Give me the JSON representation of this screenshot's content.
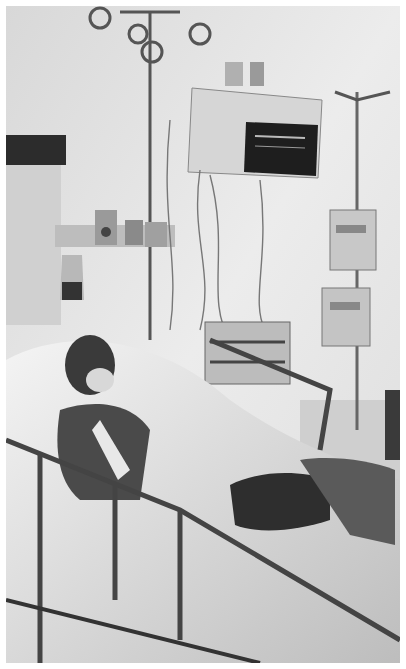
{
  "image": {
    "description": "Grayscale photograph of a patient lying in a hospital ICU bed, intubated, with a vital-signs monitor mounted on the wall, IV poles with infusion pumps, tubing and bed side rails",
    "palette": {
      "wall": "#e4e4e4",
      "dark": "#2a2a2a",
      "mid": "#8a8a8a",
      "sheet": "#f0f0f0",
      "border": "#ffffff"
    },
    "objects": [
      {
        "name": "vital-signs-monitor",
        "screen_color": "#1e1e1e"
      },
      {
        "name": "iv-pole-right",
        "pumps": 2
      },
      {
        "name": "iv-hooks-ceiling"
      },
      {
        "name": "wall-equipment-rail"
      },
      {
        "name": "bedside-cabinet"
      },
      {
        "name": "hospital-bed",
        "side_rails": true
      },
      {
        "name": "patient",
        "intubated": true
      },
      {
        "name": "blood-collection-bag"
      }
    ]
  }
}
